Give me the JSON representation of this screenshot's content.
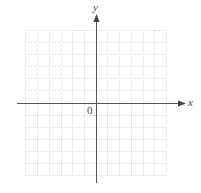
{
  "diagram": {
    "type": "coordinate-grid",
    "x_axis_label": "x",
    "y_axis_label": "y",
    "origin_label": "0",
    "grid": {
      "columns": 12,
      "rows": 12
    },
    "colors": {
      "axis": "#555555",
      "grid": "#d9d9d9",
      "label": "#444444"
    }
  }
}
